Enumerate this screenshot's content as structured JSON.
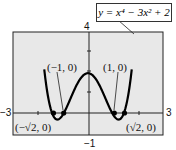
{
  "chart_data": {
    "type": "line",
    "title": "",
    "equation": "y = x⁴ − 3x² + 2",
    "xlabel": "",
    "ylabel": "",
    "xlim": [
      -3,
      3
    ],
    "ylim": [
      -1,
      4
    ],
    "grid": false,
    "tick_labels": {
      "xmin": "−3",
      "xmax": "3",
      "ymin": "−1",
      "ymax": "4"
    },
    "x": [
      -1.55,
      -1.5,
      -1.414,
      -1.3,
      -1.2,
      -1.0,
      -0.8,
      -0.5,
      0,
      0.5,
      0.8,
      1.0,
      1.2,
      1.3,
      1.414,
      1.5,
      1.55
    ],
    "y": [
      0.571,
      0.3125,
      0.0,
      -0.2139,
      -0.2464,
      0.0,
      0.4896,
      1.3125,
      2.0,
      1.3125,
      0.4896,
      0.0,
      -0.2464,
      -0.2139,
      0.0,
      0.3125,
      0.571
    ],
    "annotations": [
      {
        "text": "(−1, 0)",
        "x": -1,
        "y": 0
      },
      {
        "text": "(1, 0)",
        "x": 1,
        "y": 0
      },
      {
        "text": "(−√2, 0)",
        "x": -1.414,
        "y": 0
      },
      {
        "text": "(√2, 0)",
        "x": 1.414,
        "y": 0
      }
    ]
  },
  "labels": {
    "equation": "y = x⁴ − 3x² + 2",
    "neg_one": "(−1, 0)",
    "pos_one": "(1, 0)",
    "neg_sqrt2": "(−√2, 0)",
    "pos_sqrt2": "(√2, 0)",
    "xmin": "−3",
    "xmax": "3",
    "ymin": "−1",
    "ymax": "4"
  }
}
